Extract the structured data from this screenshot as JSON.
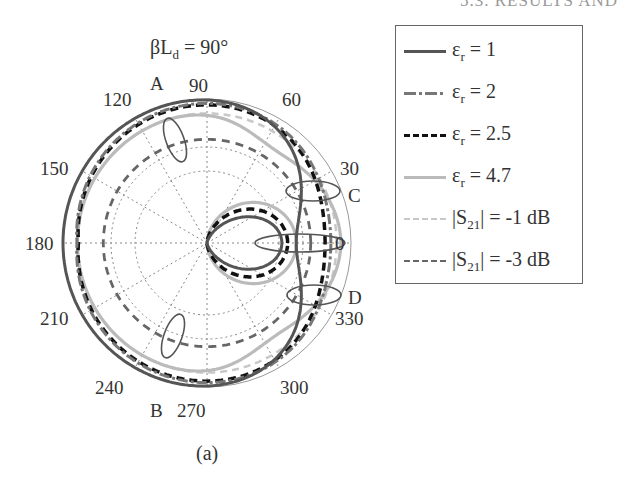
{
  "page": {
    "header_fragment": "5.3. RESULTS AND",
    "caption": "(a)"
  },
  "chart_data": {
    "type": "polar-line",
    "title": "βLd = 90°",
    "title_parts": {
      "base": "βL",
      "sub": "d",
      "rest": " = 90°"
    },
    "angular_ticks": [
      "0",
      "30",
      "60",
      "90",
      "120",
      "150",
      "180",
      "210",
      "240",
      "270",
      "300",
      "330"
    ],
    "radial_grid": "dotted, 2 inner rings + 12 spokes",
    "annotations": [
      {
        "label": "A",
        "angle_deg": 110
      },
      {
        "label": "B",
        "angle_deg": 250
      },
      {
        "label": "C",
        "angle_deg": 20
      },
      {
        "label": "D",
        "angle_deg": 340
      }
    ],
    "legend_position": "right",
    "series": [
      {
        "name": "εr = 1",
        "style": "solid",
        "color": "#555555",
        "shape": "main lobe ~1.0 broad, backlobe small, deep null near 0°/small forward lobe ~0.5"
      },
      {
        "name": "εr = 2",
        "style": "dash-dot",
        "color": "#777777",
        "shape": "main lobe ~0.95"
      },
      {
        "name": "εr = 2.5",
        "style": "dashed",
        "color": "#111111",
        "shape": "main lobe ~0.95, forward lobe ~0.55"
      },
      {
        "name": "εr = 4.7",
        "style": "solid",
        "color": "#bbbbbb",
        "shape": "main lobe ~0.9 at sides, forward lobe ~0.6"
      },
      {
        "name": "|S21| = -1 dB",
        "style": "dashed",
        "color": "#c8c8c8",
        "shape": "circle r ≈ 0.89"
      },
      {
        "name": "|S21| = -3 dB",
        "style": "dashed",
        "color": "#666666",
        "shape": "circle r ≈ 0.71"
      }
    ],
    "legend": [
      {
        "base": "ε",
        "sub": "r",
        "rest": " = 1"
      },
      {
        "base": "ε",
        "sub": "r",
        "rest": " = 2"
      },
      {
        "base": "ε",
        "sub": "r",
        "rest": " = 2.5"
      },
      {
        "base": "ε",
        "sub": "r",
        "rest": " = 4.7"
      },
      {
        "base": "|S",
        "sub": "21",
        "rest": "| = -1 dB"
      },
      {
        "base": "|S",
        "sub": "21",
        "rest": "| = -3 dB"
      }
    ]
  }
}
